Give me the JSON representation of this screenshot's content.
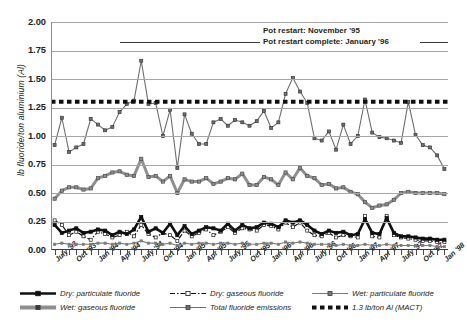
{
  "axes": {
    "ylabel": "lb fluoride/ton aluminium (Al)",
    "yticks": [
      "2.00",
      "1.75",
      "1.50",
      "1.25",
      "1.00",
      "0.75",
      "0.50",
      "0.25",
      "0.00"
    ],
    "xticks": [
      "July '93",
      "Oct '93",
      "Jan '94",
      "Apr '94",
      "July '94",
      "Oct '94",
      "Jan '95",
      "Apr '95",
      "July '95",
      "Oct '95",
      "Jan '96",
      "Apr '96",
      "July '96",
      "Oct '96",
      "Jan '97",
      "Apr '97",
      "July '97",
      "Oct '97",
      "Jan '98"
    ]
  },
  "annotations": {
    "pot_restart": "Pot restart: November '95",
    "pot_restart_complete": "Pot restart complete: January '96"
  },
  "legend": {
    "items": [
      {
        "label": "Dry: particulate fluoride",
        "marker": "black-thick-line-square",
        "color": "#101010"
      },
      {
        "label": "Dry: gaseous fluoride",
        "marker": "black-dashdot-line-open-square",
        "color": "#101010"
      },
      {
        "label": "Wet: particulate fluoride",
        "marker": "gray-thin-line-square",
        "color": "#7a7a7a"
      },
      {
        "label": "Wet: gaseous fluoride",
        "marker": "gray-thick-line-square",
        "color": "#8f8f8f"
      },
      {
        "label": "Total fluoride emissions",
        "marker": "gray-thin-line-square",
        "color": "#6e6e6e"
      },
      {
        "label": "1.3 lb/ton Al (MACT)",
        "marker": "black-thick-dotted-line",
        "color": "#101010"
      }
    ]
  },
  "chart_data": {
    "type": "line",
    "title": "",
    "xlabel": "",
    "ylabel": "lb fluoride/ton aluminium (Al)",
    "ylim": [
      0,
      2.0
    ],
    "ytick_step": 0.25,
    "grid": true,
    "legend_position": "bottom",
    "x": [
      "July '93",
      "Aug '93",
      "Sep '93",
      "Oct '93",
      "Nov '93",
      "Dec '93",
      "Jan '94",
      "Feb '94",
      "Mar '94",
      "Apr '94",
      "May '94",
      "June '94",
      "July '94",
      "Aug '94",
      "Sep '94",
      "Oct '94",
      "Nov '94",
      "Dec '94",
      "Jan '95",
      "Feb '95",
      "Mar '95",
      "Apr '95",
      "May '95",
      "June '95",
      "July '95",
      "Aug '95",
      "Sep '95",
      "Oct '95",
      "Nov '95",
      "Dec '95",
      "Jan '96",
      "Feb '96",
      "Mar '96",
      "Apr '96",
      "May '96",
      "June '96",
      "July '96",
      "Aug '96",
      "Sep '96",
      "Oct '96",
      "Nov '96",
      "Dec '96",
      "Jan '97",
      "Feb '97",
      "Mar '97",
      "Apr '97",
      "May '97",
      "June '97",
      "July '97",
      "Aug '97",
      "Sep '97",
      "Oct '97",
      "Nov '97",
      "Dec '97",
      "Jan '98"
    ],
    "series": [
      {
        "name": "Total fluoride emissions",
        "color": "#6e6e6e",
        "style": "thin-line-marker",
        "values": [
          0.92,
          1.16,
          0.86,
          0.9,
          0.93,
          1.15,
          1.1,
          1.05,
          1.08,
          1.21,
          1.28,
          1.31,
          1.66,
          1.28,
          1.29,
          1.0,
          1.23,
          0.72,
          1.19,
          1.02,
          0.93,
          0.93,
          1.12,
          1.15,
          1.09,
          1.14,
          1.12,
          1.09,
          1.13,
          1.22,
          1.07,
          1.12,
          1.37,
          1.51,
          1.39,
          1.29,
          0.98,
          0.96,
          1.04,
          0.88,
          1.1,
          0.93,
          1.0,
          1.32,
          1.03,
          0.99,
          0.98,
          0.96,
          0.94,
          1.3,
          1.01,
          0.92,
          0.9,
          0.83,
          0.71
        ]
      },
      {
        "name": "Wet: gaseous fluoride",
        "color": "#8f8f8f",
        "style": "thick-line-marker",
        "values": [
          0.45,
          0.52,
          0.55,
          0.55,
          0.53,
          0.54,
          0.63,
          0.65,
          0.68,
          0.69,
          0.66,
          0.65,
          0.8,
          0.64,
          0.65,
          0.6,
          0.65,
          0.5,
          0.62,
          0.6,
          0.6,
          0.63,
          0.58,
          0.6,
          0.63,
          0.62,
          0.67,
          0.57,
          0.57,
          0.64,
          0.62,
          0.57,
          0.68,
          0.62,
          0.72,
          0.65,
          0.63,
          0.57,
          0.58,
          0.54,
          0.55,
          0.51,
          0.49,
          0.42,
          0.37,
          0.39,
          0.4,
          0.44,
          0.5,
          0.51,
          0.5,
          0.5,
          0.5,
          0.5,
          0.49
        ]
      },
      {
        "name": "Dry: particulate fluoride",
        "color": "#101010",
        "style": "thick-black-line-marker",
        "values": [
          0.22,
          0.15,
          0.17,
          0.19,
          0.15,
          0.16,
          0.18,
          0.17,
          0.13,
          0.16,
          0.14,
          0.18,
          0.29,
          0.16,
          0.19,
          0.15,
          0.23,
          0.13,
          0.21,
          0.14,
          0.17,
          0.2,
          0.19,
          0.17,
          0.23,
          0.17,
          0.22,
          0.19,
          0.2,
          0.24,
          0.23,
          0.2,
          0.26,
          0.24,
          0.26,
          0.22,
          0.17,
          0.14,
          0.17,
          0.15,
          0.16,
          0.13,
          0.14,
          0.27,
          0.15,
          0.14,
          0.28,
          0.15,
          0.12,
          0.12,
          0.11,
          0.1,
          0.1,
          0.09,
          0.09
        ]
      },
      {
        "name": "Dry: gaseous fluoride",
        "color": "#101010",
        "style": "dashdot-open-square",
        "values": [
          0.26,
          0.22,
          0.13,
          0.16,
          0.12,
          0.09,
          0.16,
          0.14,
          0.11,
          0.13,
          0.16,
          0.12,
          0.22,
          0.14,
          0.11,
          0.15,
          0.13,
          0.08,
          0.17,
          0.12,
          0.15,
          0.18,
          0.13,
          0.16,
          0.2,
          0.15,
          0.19,
          0.18,
          0.17,
          0.22,
          0.21,
          0.18,
          0.24,
          0.2,
          0.24,
          0.17,
          0.13,
          0.12,
          0.15,
          0.11,
          0.13,
          0.12,
          0.11,
          0.3,
          0.12,
          0.11,
          0.3,
          0.13,
          0.11,
          0.1,
          0.09,
          0.08,
          0.08,
          0.07,
          0.07
        ]
      },
      {
        "name": "Wet: particulate fluoride",
        "color": "#7a7a7a",
        "style": "thin-line-marker",
        "values": [
          0.05,
          0.06,
          0.05,
          0.05,
          0.05,
          0.05,
          0.06,
          0.06,
          0.05,
          0.06,
          0.05,
          0.06,
          0.08,
          0.06,
          0.06,
          0.05,
          0.06,
          0.04,
          0.06,
          0.05,
          0.06,
          0.06,
          0.05,
          0.06,
          0.06,
          0.05,
          0.06,
          0.05,
          0.05,
          0.06,
          0.06,
          0.05,
          0.07,
          0.06,
          0.07,
          0.06,
          0.05,
          0.05,
          0.05,
          0.04,
          0.05,
          0.04,
          0.04,
          0.05,
          0.04,
          0.04,
          0.05,
          0.04,
          0.04,
          0.04,
          0.04,
          0.04,
          0.04,
          0.03,
          0.03
        ]
      }
    ],
    "reference_line": {
      "label": "1.3 lb/ton Al (MACT)",
      "value": 1.3,
      "style": "thick-dotted",
      "color": "#101010"
    }
  }
}
